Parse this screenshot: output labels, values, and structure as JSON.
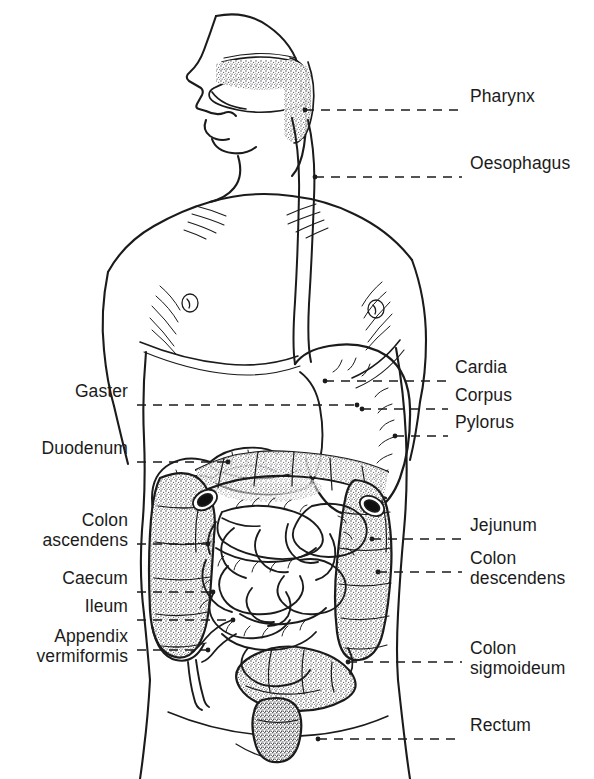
{
  "figure": {
    "background_color": "#ffffff",
    "ink_color": "#1b1b1b",
    "stipple_color": "#55555a",
    "view": "anterior view of torso with left-facing head profile",
    "width": 594,
    "height": 779
  },
  "labels": {
    "right": [
      {
        "id": "pharynx",
        "text": "Pharynx",
        "text_x": 470,
        "text_y": 100,
        "leader_y": 110,
        "leader_x1": 305,
        "leader_x2": 462,
        "lines": [
          "Pharynx"
        ]
      },
      {
        "id": "oesophagus",
        "text": "Oesophagus",
        "text_x": 470,
        "text_y": 167,
        "leader_y": 177,
        "leader_x1": 315,
        "leader_x2": 462,
        "lines": [
          "Oesophagus"
        ]
      },
      {
        "id": "cardia",
        "text": "Cardia",
        "text_x": 455,
        "text_y": 371,
        "leader_y": 381,
        "leader_x1": 325,
        "leader_x2": 448,
        "lines": [
          "Cardia"
        ]
      },
      {
        "id": "corpus",
        "text": "Corpus",
        "text_x": 455,
        "text_y": 399,
        "leader_y": 409,
        "leader_x1": 362,
        "leader_x2": 448,
        "lines": [
          "Corpus"
        ]
      },
      {
        "id": "pylorus",
        "text": "Pylorus",
        "text_x": 455,
        "text_y": 426,
        "leader_y": 436,
        "leader_x1": 395,
        "leader_x2": 448,
        "lines": [
          "Pylorus"
        ]
      },
      {
        "id": "jejunum",
        "text": "Jejunum",
        "text_x": 470,
        "text_y": 529,
        "leader_y": 539,
        "leader_x1": 372,
        "leader_x2": 462,
        "lines": [
          "Jejunum"
        ]
      },
      {
        "id": "colon-descendens",
        "text": "Colon descendens",
        "text_x": 470,
        "text_y": 562,
        "leader_y": 572,
        "leader_x1": 378,
        "leader_x2": 462,
        "lines": [
          "Colon",
          "descendens"
        ]
      },
      {
        "id": "colon-sigmoideum",
        "text": "Colon sigmoideum",
        "text_x": 470,
        "text_y": 652,
        "leader_y": 662,
        "leader_x1": 348,
        "leader_x2": 462,
        "lines": [
          "Colon",
          "sigmoideum"
        ]
      },
      {
        "id": "rectum",
        "text": "Rectum",
        "text_x": 470,
        "text_y": 729,
        "leader_y": 739,
        "leader_x1": 318,
        "leader_x2": 462,
        "lines": [
          "Rectum"
        ]
      }
    ],
    "left": [
      {
        "id": "gaster",
        "text": "Gaster",
        "text_x": 128,
        "text_y": 395,
        "leader_y": 405,
        "leader_x1": 137,
        "leader_x2": 357,
        "lines": [
          "Gaster"
        ]
      },
      {
        "id": "duodenum",
        "text": "Duodenum",
        "text_x": 128,
        "text_y": 452,
        "leader_y": 462,
        "leader_x1": 137,
        "leader_x2": 228,
        "lines": [
          "Duodenum"
        ]
      },
      {
        "id": "colon-ascendens",
        "text": "Colon ascendens",
        "text_x": 128,
        "text_y": 524,
        "leader_y": 544,
        "leader_x1": 137,
        "leader_x2": 208,
        "lines": [
          "Colon",
          "ascendens"
        ]
      },
      {
        "id": "caecum",
        "text": "Caecum",
        "text_x": 128,
        "text_y": 582,
        "leader_y": 592,
        "leader_x1": 137,
        "leader_x2": 213,
        "lines": [
          "Caecum"
        ]
      },
      {
        "id": "ileum",
        "text": "Ileum",
        "text_x": 128,
        "text_y": 610,
        "leader_y": 620,
        "leader_x1": 137,
        "leader_x2": 233,
        "lines": [
          "Ileum"
        ]
      },
      {
        "id": "appendix-vermiformis",
        "text": "Appendix vermiformis",
        "text_x": 128,
        "text_y": 640,
        "leader_y": 650,
        "leader_x1": 137,
        "leader_x2": 208,
        "lines": [
          "Appendix",
          "vermiformis"
        ]
      }
    ]
  },
  "organs": [
    {
      "id": "oral-cavity",
      "name": "Oral cavity / tongue"
    },
    {
      "id": "pharynx",
      "name": "Pharynx"
    },
    {
      "id": "oesophagus",
      "name": "Oesophagus"
    },
    {
      "id": "stomach",
      "name": "Gaster (stomach)"
    },
    {
      "id": "duodenum",
      "name": "Duodenum"
    },
    {
      "id": "jejunum",
      "name": "Jejunum / small intestine coils"
    },
    {
      "id": "ileum",
      "name": "Ileum"
    },
    {
      "id": "caecum",
      "name": "Caecum"
    },
    {
      "id": "appendix",
      "name": "Appendix vermiformis"
    },
    {
      "id": "colon-asc",
      "name": "Colon ascendens"
    },
    {
      "id": "colon-trans",
      "name": "Colon transversum"
    },
    {
      "id": "colon-desc",
      "name": "Colon descendens"
    },
    {
      "id": "colon-sigm",
      "name": "Colon sigmoideum"
    },
    {
      "id": "rectum",
      "name": "Rectum"
    },
    {
      "id": "body-outline",
      "name": "Body outline (head, torso, arms, hips)"
    }
  ]
}
